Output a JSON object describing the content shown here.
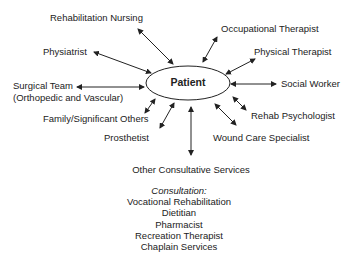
{
  "diagram": {
    "center_node": "Patient",
    "nodes": [
      {
        "id": "rehab-nursing",
        "label": "Rehabilitation Nursing",
        "relation": "bidirectional"
      },
      {
        "id": "physiatrist",
        "label": "Physiatrist",
        "relation": "bidirectional"
      },
      {
        "id": "surgical-team",
        "label": "Surgical Team",
        "label2": "(Orthopedic and Vascular)",
        "relation": "bidirectional"
      },
      {
        "id": "family",
        "label": "Family/Significant Others",
        "relation": "bidirectional"
      },
      {
        "id": "prosthetist",
        "label": "Prosthetist",
        "relation": "bidirectional"
      },
      {
        "id": "occupational-therapist",
        "label": "Occupational Therapist",
        "relation": "bidirectional"
      },
      {
        "id": "physical-therapist",
        "label": "Physical Therapist",
        "relation": "bidirectional"
      },
      {
        "id": "social-worker",
        "label": "Social Worker",
        "relation": "bidirectional"
      },
      {
        "id": "rehab-psychologist",
        "label": "Rehab Psychologist",
        "relation": "bidirectional"
      },
      {
        "id": "wound-care",
        "label": "Wound Care Specialist",
        "relation": "bidirectional"
      },
      {
        "id": "other-consultative",
        "label": "Other Consultative Services",
        "relation": "bidirectional"
      }
    ],
    "consultation": {
      "heading": "Consultation:",
      "items": [
        "Vocational Rehabilitation",
        "Dietitian",
        "Pharmacist",
        "Recreation Therapist",
        "Chaplain Services"
      ]
    }
  }
}
